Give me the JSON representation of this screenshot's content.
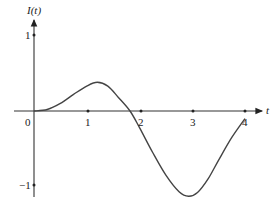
{
  "chart_data": {
    "type": "line",
    "title": "",
    "xlabel": "t",
    "ylabel": "I(t)",
    "xlim": [
      0,
      4
    ],
    "ylim": [
      -1,
      1
    ],
    "x_ticks": [
      "0",
      "1",
      "2",
      "3",
      "4"
    ],
    "y_ticks": [
      "1",
      "-1"
    ],
    "grid": false,
    "legend": null,
    "series": [
      {
        "name": "I(t)",
        "x": [
          0,
          0.25,
          0.5,
          0.75,
          1.0,
          1.2,
          1.4,
          1.6,
          1.82,
          2.0,
          2.25,
          2.5,
          2.75,
          2.93,
          3.1,
          3.3,
          3.5,
          3.75,
          4.0
        ],
        "y": [
          0,
          0.02,
          0.1,
          0.22,
          0.33,
          0.38,
          0.33,
          0.18,
          0,
          -0.22,
          -0.55,
          -0.85,
          -1.07,
          -1.13,
          -1.08,
          -0.9,
          -0.65,
          -0.35,
          -0.1
        ]
      }
    ],
    "annotations": []
  },
  "labels": {
    "ylabel": "I(t)",
    "xlabel": "t",
    "origin": "0",
    "x1": "1",
    "x2": "2",
    "x3": "3",
    "x4": "4",
    "y1": "1",
    "yneg1": "−1"
  }
}
